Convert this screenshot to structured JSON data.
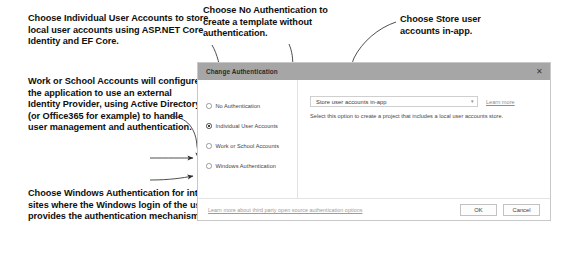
{
  "annotations": [
    {
      "id": "individual-user-accounts-note",
      "text": "Choose Individual User Accounts to store local user accounts using ASP.NET Core Identity and EF Core."
    },
    {
      "id": "work-or-school-accounts-note",
      "text": "Work or School Accounts will configure the application to use an external Identity Provider, using Active Directory (or Office365 for example) to handle user management and authentication."
    },
    {
      "id": "windows-authentication-note",
      "text": "Choose Windows Authentication for intranet sites where the Windows login of the user provides the authentication mechanism."
    },
    {
      "id": "no-authentication-note",
      "text": "Choose No Authentication to create a template without authentication."
    },
    {
      "id": "store-user-accounts-note",
      "text": "Choose Store user accounts in-app."
    }
  ],
  "dialog": {
    "title": "Change Authentication",
    "close_label": "✕",
    "radio_options": [
      {
        "label": "No Authentication",
        "selected": false
      },
      {
        "label": "Individual User Accounts",
        "selected": true
      },
      {
        "label": "Work or School Accounts",
        "selected": false
      },
      {
        "label": "Windows Authentication",
        "selected": false
      }
    ],
    "combo": {
      "value": "Store user accounts in-app",
      "arrow": "▾"
    },
    "learn_more_label": "Learn more",
    "description": "Select this option to create a project that includes a local user accounts store.",
    "footer": {
      "link_label": "Learn more about third party open source authentication options",
      "ok_label": "OK",
      "cancel_label": "Cancel"
    }
  },
  "colors": {
    "titlebar": "#a6a6a6",
    "dialog_border": "#c8c8c8",
    "annotation_text": "#100f0d",
    "connector": "#3a3a3a"
  }
}
